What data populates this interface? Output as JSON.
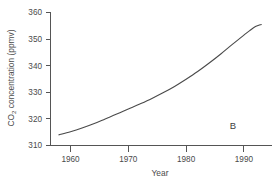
{
  "figure": {
    "panel_label": "B",
    "background_color": "#ffffff",
    "line_color": "#4a4a4a",
    "axis_color": "#555555",
    "text_color": "#4a4a4a"
  },
  "chart_data": {
    "type": "line",
    "title": "",
    "xlabel": "Year",
    "ylabel_main": "CO",
    "ylabel_sub": "2",
    "ylabel_rest": " concentration (ppmv)",
    "ylabel": "CO2 concentration (ppmv)",
    "xlim": [
      1957,
      1994
    ],
    "ylim": [
      310,
      360
    ],
    "xticks": [
      1960,
      1970,
      1980,
      1990
    ],
    "xtick_labels": [
      "1960",
      "1970",
      "1980",
      "1990"
    ],
    "yticks": [
      310,
      320,
      330,
      340,
      350,
      360
    ],
    "ytick_labels": [
      "310",
      "320",
      "330",
      "340",
      "350",
      "360"
    ],
    "grid": false,
    "legend": false,
    "series": [
      {
        "name": "CO2 concentration",
        "x": [
          1958,
          1960,
          1962,
          1964,
          1966,
          1968,
          1970,
          1972,
          1974,
          1976,
          1978,
          1980,
          1982,
          1984,
          1986,
          1988,
          1990,
          1991,
          1992,
          1993
        ],
        "values": [
          314.0,
          315.2,
          316.6,
          318.2,
          320.0,
          321.8,
          323.7,
          325.6,
          327.6,
          329.8,
          332.2,
          334.9,
          337.8,
          341.0,
          344.4,
          348.0,
          351.5,
          353.2,
          354.7,
          355.5
        ]
      }
    ]
  }
}
